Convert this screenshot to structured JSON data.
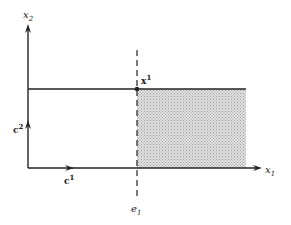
{
  "figure": {
    "axes": {
      "x_label": "x",
      "x_sub": "1",
      "y_label": "x",
      "y_sub": "2"
    },
    "vectors": {
      "c1_label": "c",
      "c1_sup": "1",
      "c2_label": "c",
      "c2_sup": "2"
    },
    "point": {
      "label": "x",
      "sup": "1"
    },
    "dashed_line": {
      "label": "e",
      "sub": "1"
    },
    "colors": {
      "line": "#222222",
      "shade": "#c8c8c8",
      "background": "#ffffff"
    }
  }
}
